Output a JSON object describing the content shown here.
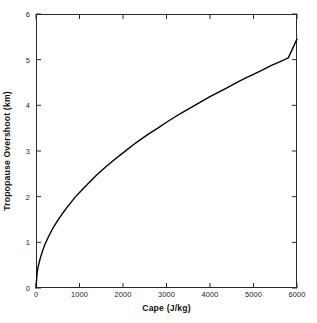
{
  "chart_data": {
    "type": "line",
    "title": "",
    "xlabel": "Cape (J/kg)",
    "ylabel": "Tropopause Overshoot (km)",
    "xlim": [
      0,
      6000
    ],
    "ylim": [
      0,
      6
    ],
    "xticks": [
      0,
      1000,
      2000,
      3000,
      4000,
      5000,
      6000
    ],
    "yticks": [
      0,
      1,
      2,
      3,
      4,
      5,
      6
    ],
    "xtick_labels": [
      "0",
      "1000",
      "2000",
      "3000",
      "4000",
      "5000",
      "6000"
    ],
    "ytick_labels": [
      "0",
      "1",
      "2",
      "3",
      "4",
      "5",
      "6"
    ],
    "grid": false,
    "legend": null,
    "line_color": "#000000",
    "line_width": 1.4,
    "series": [
      {
        "name": "Tropopause Overshoot",
        "x": [
          0,
          25,
          50,
          100,
          150,
          200,
          300,
          400,
          500,
          600,
          700,
          800,
          900,
          1000,
          1200,
          1400,
          1600,
          1800,
          2000,
          2200,
          2400,
          2600,
          2800,
          3000,
          3200,
          3400,
          3600,
          3800,
          4000,
          4200,
          4400,
          4600,
          4800,
          5000,
          5200,
          5400,
          5600,
          5800,
          6000
        ],
        "y": [
          0.0,
          0.33,
          0.47,
          0.66,
          0.81,
          0.94,
          1.15,
          1.33,
          1.48,
          1.62,
          1.75,
          1.87,
          1.99,
          2.09,
          2.29,
          2.48,
          2.65,
          2.81,
          2.96,
          3.11,
          3.25,
          3.38,
          3.5,
          3.63,
          3.75,
          3.86,
          3.97,
          4.08,
          4.19,
          4.29,
          4.39,
          4.49,
          4.59,
          4.68,
          4.77,
          4.87,
          4.95,
          5.04,
          5.45
        ]
      }
    ]
  },
  "axes": {
    "x_title": "Cape (J/kg)",
    "y_title": "Tropopause Overshoot (km)"
  }
}
